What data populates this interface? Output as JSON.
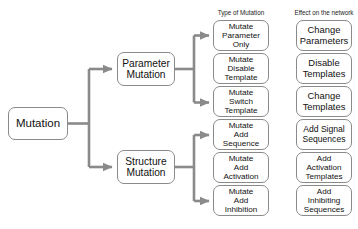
{
  "diagram": {
    "title_absent": true,
    "root": {
      "label": "Mutation"
    },
    "branches": [
      {
        "label_line1": "Parameter",
        "label_line2": "Mutation"
      },
      {
        "label_line1": "Structure",
        "label_line2": "Mutation"
      }
    ],
    "column_headers": {
      "type_of_mutation": "Type of Mutation",
      "effect_on_the_network": "Effect on the network"
    },
    "rows": [
      {
        "type_lines": [
          "Mutate",
          "Parameter",
          "Only"
        ],
        "effect_lines": [
          "Change",
          "Parameters"
        ],
        "parent": "Parameter Mutation",
        "has_arrow": true
      },
      {
        "type_lines": [
          "Mutate",
          "Disable",
          "Template"
        ],
        "effect_lines": [
          "Disable",
          "Templates"
        ],
        "parent": "Parameter Mutation",
        "has_arrow": false
      },
      {
        "type_lines": [
          "Mutate",
          "Switch",
          "Template"
        ],
        "effect_lines": [
          "Change",
          "Templates"
        ],
        "parent": "Parameter Mutation",
        "has_arrow": true
      },
      {
        "type_lines": [
          "Mutate",
          "Add",
          "Sequence"
        ],
        "effect_lines": [
          "Add Signal",
          "Sequences"
        ],
        "parent": "Structure Mutation",
        "has_arrow": true
      },
      {
        "type_lines": [
          "Mutate",
          "Add",
          "Activation"
        ],
        "effect_lines": [
          "Add",
          "Activation",
          "Templates"
        ],
        "parent": "Structure Mutation",
        "has_arrow": false
      },
      {
        "type_lines": [
          "Mutate",
          "Add",
          "Inhibition"
        ],
        "effect_lines": [
          "Add",
          "Inhibiting",
          "Sequences"
        ],
        "parent": "Structure Mutation",
        "has_arrow": true
      }
    ],
    "colors": {
      "connector": "#8a8a8a",
      "box_border": "#8a8a8a",
      "box_fill": "#ffffff",
      "text": "#111111",
      "background": "#ffffff"
    }
  }
}
